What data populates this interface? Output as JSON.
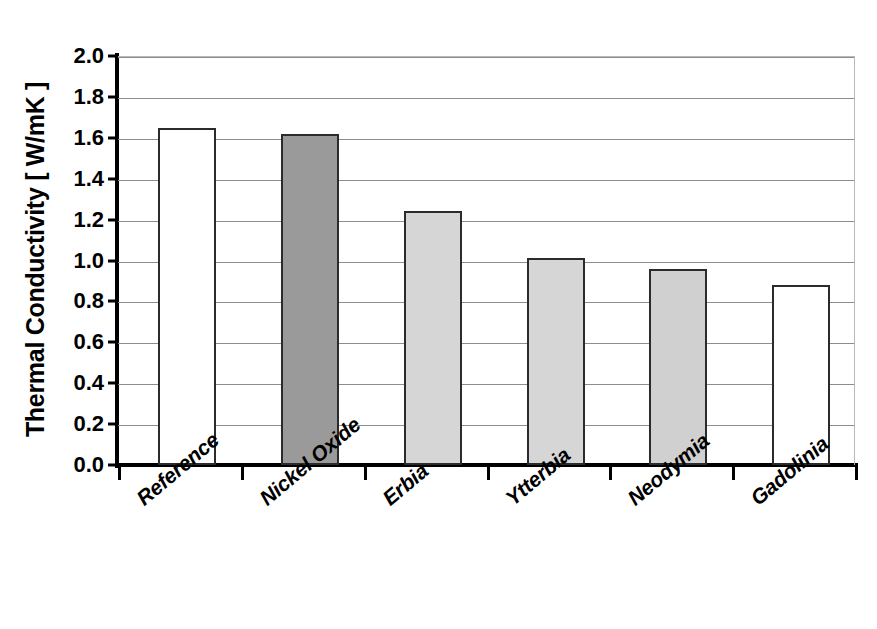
{
  "chart_data": {
    "type": "bar",
    "title": "",
    "xlabel": "",
    "ylabel": "Thermal Conductivity [ W/mK ]",
    "categories": [
      "Reference",
      "Nickel Oxide",
      "Erbia",
      "Ytterbia",
      "Neodymia",
      "Gadolinia"
    ],
    "values": [
      1.65,
      1.62,
      1.24,
      1.01,
      0.96,
      0.88
    ],
    "bar_colors": [
      "#ffffff",
      "#9a9a9a",
      "#d6d6d6",
      "#d6d6d6",
      "#d0d0d0",
      "#ffffff"
    ],
    "bar_edge_color": "#2b2b2b",
    "ylim": [
      0.0,
      2.0
    ],
    "ytick_step": 0.2,
    "ytick_labels": [
      "2.0",
      "1.8",
      "1.6",
      "1.4",
      "1.2",
      "1.0",
      "0.8",
      "0.6",
      "0.4",
      "0.2",
      "0.0"
    ],
    "ytick_values": [
      2.0,
      1.8,
      1.6,
      1.4,
      1.2,
      1.0,
      0.8,
      0.6,
      0.4,
      0.2,
      0.0
    ],
    "grid": true,
    "grid_axis": "y",
    "grid_color": "#8d8d8d",
    "legend": null,
    "legend_position": "none",
    "background_color": "#ffffff",
    "axis_color": "#000000",
    "xtick_rotation": -40
  }
}
